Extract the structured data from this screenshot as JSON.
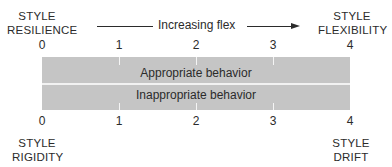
{
  "corners": {
    "top_left": {
      "line1": "STYLE",
      "line2": "RESILIENCE"
    },
    "top_right": {
      "line1": "STYLE",
      "line2": "FLEXIBILITY"
    },
    "bottom_left": {
      "line1": "STYLE",
      "line2": "RIGIDITY"
    },
    "bottom_right": {
      "line1": "STYLE",
      "line2": "DRIFT"
    }
  },
  "axis": {
    "label": "Increasing flex",
    "direction": "left-to-right"
  },
  "scale_top": [
    "0",
    "1",
    "2",
    "3",
    "4"
  ],
  "scale_bottom": [
    "0",
    "1",
    "2",
    "3",
    "4"
  ],
  "bar": {
    "top_row": "Appropriate behavior",
    "bottom_row": "Inappropriate behavior",
    "fill_color": "#c5c5c5"
  }
}
